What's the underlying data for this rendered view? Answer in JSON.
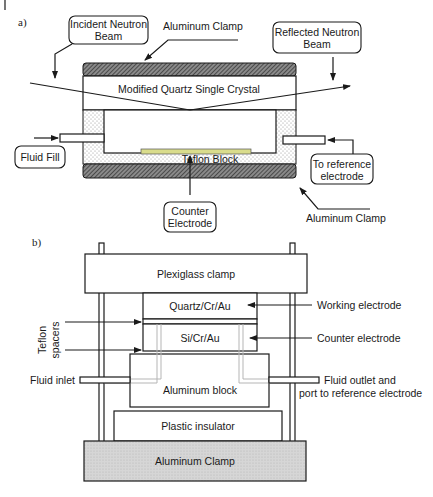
{
  "figure": {
    "panel_a": {
      "label": "a)",
      "callouts": {
        "incident_line1": "Incident Neutron",
        "incident_line2": "Beam",
        "reflected_line1": "Reflected Neutron",
        "reflected_line2": "Beam",
        "fluid_fill": "Fluid Fill",
        "to_ref_line1": "To reference",
        "to_ref_line2": "electrode",
        "counter_line1": "Counter",
        "counter_line2": "Electrode"
      },
      "labels": {
        "aluminum_clamp_top": "Aluminum Clamp",
        "quartz_crystal": "Modified Quartz Single Crystal",
        "teflon_block": "Teflon Block",
        "aluminum_clamp_bottom": "Aluminum Clamp"
      },
      "colors": {
        "clamp_hatch": "#4a4a4a",
        "teflon_dots": "#9a9a9a",
        "counter_electrode": "#d9dc8c"
      }
    },
    "panel_b": {
      "label": "b)",
      "labels": {
        "plexiglass_clamp": "Plexiglass clamp",
        "quartz_cr_au": "Quartz/Cr/Au",
        "si_cr_au": "Si/Cr/Au",
        "aluminum_block": "Aluminum block",
        "plastic_insulator": "Plastic insulator",
        "aluminum_clamp": "Aluminum Clamp",
        "teflon_spacers_line1": "Teflon",
        "teflon_spacers_line2": "spacers",
        "working_electrode": "Working electrode",
        "counter_electrode": "Counter electrode",
        "fluid_inlet": "Fluid inlet",
        "fluid_outlet_line1": "Fluid outlet and",
        "fluid_outlet_line2": "port to reference electrode"
      },
      "colors": {
        "aluminum_clamp_fill": "#d4d4d4"
      }
    }
  }
}
